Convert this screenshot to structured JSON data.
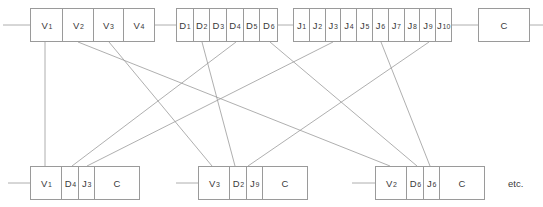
{
  "diagram": {
    "line_color": "#9a9a9a",
    "box_border_color": "#9a9a9a",
    "text_color": "#3a3a3a",
    "background": "#ffffff",
    "etc_label": "etc."
  },
  "top_row": {
    "v_group": {
      "name": "v-file",
      "cells": [
        {
          "base": "V",
          "sub": "1",
          "label": "V1"
        },
        {
          "base": "V",
          "sub": "2",
          "label": "V2"
        },
        {
          "base": "V",
          "sub": "3",
          "label": "V3"
        },
        {
          "base": "V",
          "sub": "4",
          "label": "V4"
        }
      ]
    },
    "d_group": {
      "name": "d-file",
      "cells": [
        {
          "base": "D",
          "sub": "1",
          "label": "D1"
        },
        {
          "base": "D",
          "sub": "2",
          "label": "D2"
        },
        {
          "base": "D",
          "sub": "3",
          "label": "D3"
        },
        {
          "base": "D",
          "sub": "4",
          "label": "D4"
        },
        {
          "base": "D",
          "sub": "5",
          "label": "D5"
        },
        {
          "base": "D",
          "sub": "6",
          "label": "D6"
        }
      ]
    },
    "j_group": {
      "name": "j-file",
      "cells": [
        {
          "base": "J",
          "sub": "1",
          "label": "J1"
        },
        {
          "base": "J",
          "sub": "2",
          "label": "J2"
        },
        {
          "base": "J",
          "sub": "3",
          "label": "J3"
        },
        {
          "base": "J",
          "sub": "4",
          "label": "J4"
        },
        {
          "base": "J",
          "sub": "5",
          "label": "J5"
        },
        {
          "base": "J",
          "sub": "6",
          "label": "J6"
        },
        {
          "base": "J",
          "sub": "7",
          "label": "J7"
        },
        {
          "base": "J",
          "sub": "8",
          "label": "J8"
        },
        {
          "base": "J",
          "sub": "9",
          "label": "J9"
        },
        {
          "base": "J",
          "sub": "10",
          "label": "J10"
        }
      ]
    },
    "c_group": {
      "name": "c-file",
      "cells": [
        {
          "base": "C",
          "sub": "",
          "label": "C"
        }
      ]
    }
  },
  "bottom_row": [
    {
      "name": "merged-record-1",
      "cells": [
        {
          "base": "V",
          "sub": "1",
          "label": "V1"
        },
        {
          "base": "D",
          "sub": "4",
          "label": "D4"
        },
        {
          "base": "J",
          "sub": "3",
          "label": "J3"
        },
        {
          "base": "C",
          "sub": "",
          "label": "C"
        }
      ]
    },
    {
      "name": "merged-record-2",
      "cells": [
        {
          "base": "V",
          "sub": "3",
          "label": "V3"
        },
        {
          "base": "D",
          "sub": "2",
          "label": "D2"
        },
        {
          "base": "J",
          "sub": "9",
          "label": "J9"
        },
        {
          "base": "C",
          "sub": "",
          "label": "C"
        }
      ]
    },
    {
      "name": "merged-record-3",
      "cells": [
        {
          "base": "V",
          "sub": "2",
          "label": "V2"
        },
        {
          "base": "D",
          "sub": "6",
          "label": "D6"
        },
        {
          "base": "J",
          "sub": "6",
          "label": "J6"
        },
        {
          "base": "C",
          "sub": "",
          "label": "C"
        }
      ]
    }
  ],
  "connections": [
    {
      "name": "link-v1-to-record1",
      "from": "V1",
      "to": "record1.V1",
      "x1": 45,
      "y1": 42,
      "x2": 45,
      "y2": 166
    },
    {
      "name": "link-v3-to-record2",
      "from": "V3",
      "to": "record2.V3",
      "x1": 109,
      "y1": 42,
      "x2": 212,
      "y2": 166
    },
    {
      "name": "link-v2-to-record3",
      "from": "V2",
      "to": "record3.V2",
      "x1": 78,
      "y1": 42,
      "x2": 390,
      "y2": 166
    },
    {
      "name": "link-d4-to-record1",
      "from": "D4",
      "to": "record1.D4",
      "x1": 236,
      "y1": 42,
      "x2": 72,
      "y2": 166
    },
    {
      "name": "link-d2-to-record2",
      "from": "D2",
      "to": "record2.D2",
      "x1": 202,
      "y1": 42,
      "x2": 235,
      "y2": 166
    },
    {
      "name": "link-d6-to-record3",
      "from": "D6",
      "to": "record3.D6",
      "x1": 270,
      "y1": 42,
      "x2": 417,
      "y2": 166
    },
    {
      "name": "link-j3-to-record1",
      "from": "J3",
      "to": "record1.J3",
      "x1": 333,
      "y1": 42,
      "x2": 87,
      "y2": 166
    },
    {
      "name": "link-j9-to-record2",
      "from": "J9",
      "to": "record2.J9",
      "x1": 429,
      "y1": 42,
      "x2": 248,
      "y2": 166
    },
    {
      "name": "link-j6-to-record3",
      "from": "J6",
      "to": "record3.J6",
      "x1": 381,
      "y1": 42,
      "x2": 430,
      "y2": 166
    }
  ],
  "leaders": [
    {
      "name": "leader-v-file-top",
      "x1": 3,
      "y1": 25,
      "x2": 30,
      "y2": 25
    },
    {
      "name": "leader-v-to-d-top",
      "x1": 155,
      "y1": 25,
      "x2": 176,
      "y2": 25
    },
    {
      "name": "leader-d-to-j-top",
      "x1": 278,
      "y1": 25,
      "x2": 293,
      "y2": 25
    },
    {
      "name": "leader-j-to-c-top",
      "x1": 452,
      "y1": 25,
      "x2": 478,
      "y2": 25
    },
    {
      "name": "leader-c-right-top",
      "x1": 530,
      "y1": 25,
      "x2": 543,
      "y2": 25
    },
    {
      "name": "leader-record1",
      "x1": 8,
      "y1": 183,
      "x2": 30,
      "y2": 183
    },
    {
      "name": "leader-record2",
      "x1": 176,
      "y1": 183,
      "x2": 198,
      "y2": 183
    },
    {
      "name": "leader-record3",
      "x1": 352,
      "y1": 183,
      "x2": 375,
      "y2": 183
    }
  ]
}
